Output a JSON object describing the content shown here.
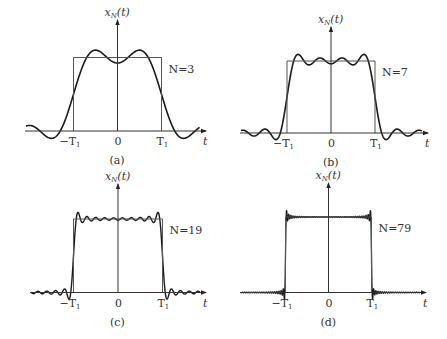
{
  "chart_data": [
    {
      "type": "line",
      "panel": "(a)",
      "title": "x_N(t)",
      "ylabel": "x_N(t)",
      "xlabel": "t",
      "series_label": "N=3",
      "N": 3,
      "tick_labels": [
        "-T1",
        "0",
        "T1"
      ],
      "description": "Fourier partial sum of periodic square pulse vs. ideal rectangle of height 1 on [-T1, T1]",
      "geom": {
        "axisX": 117.5,
        "baseY": 131,
        "t1px": 44,
        "topY": 57.5,
        "xmin": 25,
        "xmax": 206,
        "yTop": 20
      }
    },
    {
      "type": "line",
      "panel": "(b)",
      "title": "x_N(t)",
      "ylabel": "x_N(t)",
      "xlabel": "t",
      "series_label": "N=7",
      "N": 7,
      "tick_labels": [
        "-T1",
        "0",
        "T1"
      ],
      "geom": {
        "axisX": 331,
        "baseY": 133,
        "t1px": 44,
        "topY": 61,
        "xmin": 240,
        "xmax": 428,
        "yTop": 27
      }
    },
    {
      "type": "line",
      "panel": "(c)",
      "title": "x_N(t)",
      "ylabel": "x_N(t)",
      "xlabel": "t",
      "series_label": "N=19",
      "N": 19,
      "tick_labels": [
        "-T1",
        "0",
        "T1"
      ],
      "geom": {
        "axisX": 118,
        "baseY": 292.5,
        "t1px": 44.5,
        "topY": 219,
        "xmin": 30,
        "xmax": 206,
        "yTop": 184
      }
    },
    {
      "type": "line",
      "panel": "(d)",
      "title": "x_N(t)",
      "ylabel": "x_N(t)",
      "xlabel": "t",
      "series_label": "N=79",
      "N": 79,
      "tick_labels": [
        "-T1",
        "0",
        "T1"
      ],
      "geom": {
        "axisX": 328.5,
        "baseY": 292.5,
        "t1px": 43,
        "topY": 217,
        "xmin": 240,
        "xmax": 426,
        "yTop": 183
      }
    }
  ],
  "labels": {
    "y_main": "x",
    "y_sub": "N",
    "y_arg": "(t)",
    "t": "t",
    "neg_t1_main": "−T",
    "t1_main": "T",
    "t1_sub": "1",
    "zero": "0",
    "panels": [
      "(a)",
      "(b)",
      "(c)",
      "(d)"
    ],
    "n_labels": [
      "N=3",
      "N=7",
      "N=19",
      "N=79"
    ]
  }
}
